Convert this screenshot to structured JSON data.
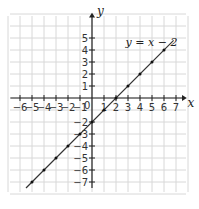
{
  "chart_data": {
    "type": "line",
    "title": "",
    "equation_label": "y = x − 2",
    "xlabel": "x",
    "ylabel": "y",
    "xlim": [
      -6,
      7
    ],
    "ylim": [
      -7,
      5
    ],
    "grid": true,
    "x_ticks": [
      -6,
      -5,
      -4,
      -3,
      -2,
      -1,
      1,
      2,
      3,
      4,
      5,
      6,
      7
    ],
    "y_ticks": [
      -7,
      -6,
      -5,
      -4,
      -3,
      -2,
      1,
      2,
      3,
      4,
      5
    ],
    "origin_label": "0",
    "series": [
      {
        "name": "y = x - 2",
        "x": [
          -5,
          -4,
          -3,
          -2,
          -1,
          0,
          1,
          2,
          3,
          4,
          5,
          6
        ],
        "y": [
          -7,
          -6,
          -5,
          -4,
          -3,
          -2,
          -1,
          0,
          1,
          2,
          3,
          4
        ],
        "line_extent": {
          "x_start": -5.5,
          "x_end": 6.8
        },
        "markers": true
      }
    ]
  },
  "colors": {
    "grid": "#d8d8d8",
    "axis": "#222222",
    "line": "#333333",
    "marker": "#111111",
    "background": "#ffffff"
  },
  "layout": {
    "origin_px": [
      92,
      98
    ],
    "unit_px": 12,
    "grid_cols": [
      -7,
      8
    ],
    "grid_rows": [
      -8,
      7
    ]
  }
}
